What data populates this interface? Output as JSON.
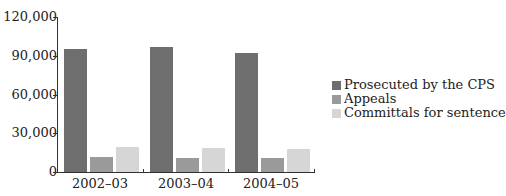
{
  "chart_data": {
    "type": "bar",
    "title": "",
    "xlabel": "",
    "ylabel": "",
    "categories": [
      "2002–03",
      "2003–04",
      "2004–05"
    ],
    "series": [
      {
        "name": "Prosecuted by the CPS",
        "color": "#6e6e6e",
        "values": [
          95300,
          96500,
          92000
        ]
      },
      {
        "name": "Appeals",
        "color": "#9a9a9a",
        "values": [
          11600,
          11000,
          10900
        ]
      },
      {
        "name": "Committals for sentence",
        "color": "#d6d6d6",
        "values": [
          19000,
          18600,
          17800
        ]
      }
    ],
    "ylim": [
      0,
      120000
    ],
    "yticks": [
      0,
      30000,
      60000,
      90000,
      120000
    ],
    "ytick_labels": [
      "0",
      "30,000",
      "60,000",
      "90,000",
      "120,000"
    ],
    "grid": false,
    "legend_position": "right"
  },
  "legend": {
    "items": [
      {
        "label": "Prosecuted by the CPS",
        "color": "#6e6e6e"
      },
      {
        "label": "Appeals",
        "color": "#9a9a9a"
      },
      {
        "label": "Committals for sentence",
        "color": "#d6d6d6"
      }
    ]
  }
}
